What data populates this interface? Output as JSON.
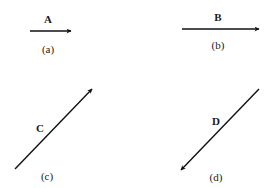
{
  "diagram": {
    "type": "vector-arrows",
    "stroke_color": "#111111",
    "panels": [
      {
        "id": "a",
        "vector_label": "A",
        "caption": "(a)",
        "direction": "right",
        "x1": 30,
        "y1": 31,
        "x2": 71,
        "y2": 31,
        "label_x": 48,
        "label_y": 23,
        "caption_x": 48,
        "caption_y": 53
      },
      {
        "id": "b",
        "vector_label": "B",
        "caption": "(b)",
        "direction": "right",
        "x1": 182,
        "y1": 29,
        "x2": 259,
        "y2": 29,
        "label_x": 218,
        "label_y": 21,
        "caption_x": 218,
        "caption_y": 49
      },
      {
        "id": "c",
        "vector_label": "C",
        "caption": "(c)",
        "direction": "up-right",
        "x1": 15,
        "y1": 169,
        "x2": 92,
        "y2": 89,
        "label_x": 40,
        "label_y": 132,
        "caption_x": 47,
        "caption_y": 180
      },
      {
        "id": "d",
        "vector_label": "D",
        "caption": "(d)",
        "direction": "down-left",
        "x1": 259,
        "y1": 89,
        "x2": 181,
        "y2": 170,
        "label_x": 216,
        "label_y": 125,
        "caption_x": 216,
        "caption_y": 181
      }
    ]
  }
}
